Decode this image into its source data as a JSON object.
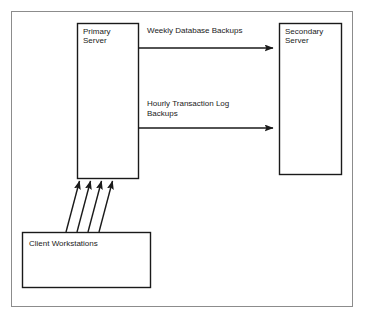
{
  "diagram": {
    "type": "block-diagram",
    "background_color": "#ffffff",
    "frame": {
      "name": "outer-frame",
      "x": 11,
      "y": 11,
      "width": 341,
      "height": 295,
      "stroke": "#8c8c8c",
      "stroke_width": 1,
      "fill": "none"
    },
    "nodes": [
      {
        "id": "primary-server",
        "label": "Primary\nServer",
        "label_line1": "Primary",
        "label_line2": "Server",
        "x": 77,
        "y": 23,
        "width": 61,
        "height": 155,
        "stroke": "#1a1a1a",
        "stroke_width": 1.4,
        "fill": "#ffffff",
        "text_color": "#1a1a1a",
        "text_x": 83,
        "text_y": 28
      },
      {
        "id": "secondary-server",
        "label": "Secondary\nServer",
        "label_line1": "Secondary",
        "label_line2": "Server",
        "x": 279,
        "y": 23,
        "width": 62,
        "height": 151,
        "stroke": "#1a1a1a",
        "stroke_width": 1.4,
        "fill": "#ffffff",
        "text_color": "#1a1a1a",
        "text_x": 285,
        "text_y": 28
      },
      {
        "id": "client-workstations",
        "label": "Client Workstations",
        "label_line1": "Client Workstations",
        "label_line2": "",
        "x": 22,
        "y": 232,
        "width": 128,
        "height": 55,
        "stroke": "#1a1a1a",
        "stroke_width": 1.4,
        "fill": "#ffffff",
        "text_color": "#1a1a1a",
        "text_x": 29,
        "text_y": 240
      }
    ],
    "edges": [
      {
        "id": "weekly-database-backups",
        "from": "primary-server",
        "to": "secondary-server",
        "label": "Weekly Database Backups",
        "label_x": 147,
        "label_y": 27,
        "path": "M 138 48 L 274 48",
        "stroke": "#1a1a1a",
        "stroke_width": 1.4,
        "arrowhead": "filled-triangle"
      },
      {
        "id": "hourly-transaction-log-backups",
        "from": "primary-server",
        "to": "secondary-server",
        "label": "Hourly Transaction Log\nBackups",
        "label_line1": "Hourly Transaction Log",
        "label_line2": "Backups",
        "label_x": 147,
        "label_y": 100,
        "path": "M 138 128 L 274 128",
        "stroke": "#1a1a1a",
        "stroke_width": 1.4,
        "arrowhead": "filled-triangle"
      },
      {
        "id": "client-connection-1",
        "from": "client-workstations",
        "to": "primary-server",
        "label": "",
        "path": "M 66 232 L 80 182",
        "stroke": "#1a1a1a",
        "stroke_width": 1.4,
        "arrowhead": "filled-triangle"
      },
      {
        "id": "client-connection-2",
        "from": "client-workstations",
        "to": "primary-server",
        "label": "",
        "path": "M 77 232 L 90 182",
        "stroke": "#1a1a1a",
        "stroke_width": 1.4,
        "arrowhead": "filled-triangle"
      },
      {
        "id": "client-connection-3",
        "from": "client-workstations",
        "to": "primary-server",
        "label": "",
        "path": "M 88 232 L 101 182",
        "stroke": "#1a1a1a",
        "stroke_width": 1.4,
        "arrowhead": "filled-triangle"
      },
      {
        "id": "client-connection-4",
        "from": "client-workstations",
        "to": "primary-server",
        "label": "",
        "path": "M 99 232 L 112 182",
        "stroke": "#1a1a1a",
        "stroke_width": 1.4,
        "arrowhead": "filled-triangle"
      }
    ]
  }
}
